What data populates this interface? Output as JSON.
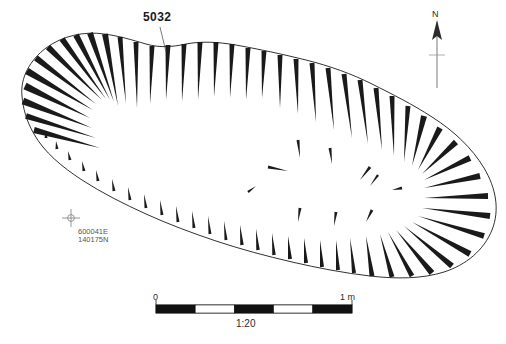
{
  "figure": {
    "type": "archaeological-hachure-plan",
    "background_color": "#ffffff",
    "line_color": "#1a1a1a"
  },
  "feature": {
    "label": "5032",
    "leader_line": true
  },
  "north_arrow": {
    "label": "N"
  },
  "grid_point": {
    "easting": "600041E",
    "northing": "140175N",
    "marker": "grid-cross-icon"
  },
  "scale_bar": {
    "min_label": "0",
    "max_label": "1 m",
    "ratio_label": "1:20",
    "segments": 5,
    "segment_colors": [
      "#111111",
      "#ffffff",
      "#111111",
      "#ffffff",
      "#111111"
    ]
  },
  "outline": {
    "path": "M 22,96 C 20,78 30,60 46,48 C 62,36 84,31 104,34 C 120,36 132,40 146,44 C 160,48 172,47 186,44 C 202,41 218,42 236,45 C 258,49 282,54 306,60 C 330,66 352,74 372,84 C 392,94 412,104 432,117 C 454,131 472,148 484,168 C 496,188 500,210 492,230 C 484,250 466,265 444,272 C 422,279 396,279 370,276 C 344,273 318,268 292,262 C 266,256 240,249 216,241 C 192,233 168,224 146,214 C 124,204 102,193 82,180 C 62,167 44,152 34,134 C 26,120 23,108 22,96 Z"
  },
  "hachures": {
    "description": "Tapered wedges, wide at outline edge, pointing inward toward feature centre",
    "outer": [
      {
        "x1": 25,
        "y1": 86,
        "x2": 90,
        "y2": 118,
        "w": 7
      },
      {
        "x1": 23,
        "y1": 101,
        "x2": 92,
        "y2": 128,
        "w": 7
      },
      {
        "x1": 26,
        "y1": 116,
        "x2": 96,
        "y2": 138,
        "w": 6
      },
      {
        "x1": 34,
        "y1": 130,
        "x2": 100,
        "y2": 148,
        "w": 6
      },
      {
        "x1": 27,
        "y1": 71,
        "x2": 93,
        "y2": 110,
        "w": 7
      },
      {
        "x1": 36,
        "y1": 58,
        "x2": 96,
        "y2": 104,
        "w": 6
      },
      {
        "x1": 48,
        "y1": 47,
        "x2": 102,
        "y2": 100,
        "w": 6
      },
      {
        "x1": 62,
        "y1": 39,
        "x2": 106,
        "y2": 99,
        "w": 6
      },
      {
        "x1": 76,
        "y1": 35,
        "x2": 110,
        "y2": 100,
        "w": 6
      },
      {
        "x1": 90,
        "y1": 33,
        "x2": 114,
        "y2": 102,
        "w": 6
      },
      {
        "x1": 105,
        "y1": 34,
        "x2": 118,
        "y2": 106,
        "w": 6
      },
      {
        "x1": 120,
        "y1": 37,
        "x2": 126,
        "y2": 104,
        "w": 5
      },
      {
        "x1": 136,
        "y1": 42,
        "x2": 137,
        "y2": 108,
        "w": 5
      },
      {
        "x1": 152,
        "y1": 46,
        "x2": 150,
        "y2": 104,
        "w": 5
      },
      {
        "x1": 168,
        "y1": 45,
        "x2": 166,
        "y2": 100,
        "w": 5
      },
      {
        "x1": 184,
        "y1": 44,
        "x2": 182,
        "y2": 102,
        "w": 5
      },
      {
        "x1": 200,
        "y1": 42,
        "x2": 198,
        "y2": 100,
        "w": 5
      },
      {
        "x1": 216,
        "y1": 42,
        "x2": 214,
        "y2": 97,
        "w": 5
      },
      {
        "x1": 232,
        "y1": 44,
        "x2": 230,
        "y2": 98,
        "w": 5
      },
      {
        "x1": 248,
        "y1": 48,
        "x2": 246,
        "y2": 100,
        "w": 5
      },
      {
        "x1": 264,
        "y1": 51,
        "x2": 262,
        "y2": 98,
        "w": 5
      },
      {
        "x1": 280,
        "y1": 55,
        "x2": 280,
        "y2": 108,
        "w": 5
      },
      {
        "x1": 296,
        "y1": 59,
        "x2": 298,
        "y2": 114,
        "w": 5
      },
      {
        "x1": 312,
        "y1": 63,
        "x2": 316,
        "y2": 122,
        "w": 5
      },
      {
        "x1": 328,
        "y1": 68,
        "x2": 334,
        "y2": 130,
        "w": 5
      },
      {
        "x1": 344,
        "y1": 74,
        "x2": 352,
        "y2": 138,
        "w": 5
      },
      {
        "x1": 360,
        "y1": 80,
        "x2": 368,
        "y2": 144,
        "w": 5
      },
      {
        "x1": 376,
        "y1": 88,
        "x2": 382,
        "y2": 150,
        "w": 5
      },
      {
        "x1": 392,
        "y1": 96,
        "x2": 394,
        "y2": 156,
        "w": 5
      },
      {
        "x1": 408,
        "y1": 106,
        "x2": 404,
        "y2": 162,
        "w": 5
      },
      {
        "x1": 424,
        "y1": 116,
        "x2": 412,
        "y2": 166,
        "w": 6
      },
      {
        "x1": 440,
        "y1": 128,
        "x2": 418,
        "y2": 170,
        "w": 6
      },
      {
        "x1": 456,
        "y1": 142,
        "x2": 422,
        "y2": 174,
        "w": 6
      },
      {
        "x1": 470,
        "y1": 158,
        "x2": 424,
        "y2": 180,
        "w": 6
      },
      {
        "x1": 480,
        "y1": 176,
        "x2": 424,
        "y2": 188,
        "w": 6
      },
      {
        "x1": 488,
        "y1": 196,
        "x2": 424,
        "y2": 198,
        "w": 6
      },
      {
        "x1": 490,
        "y1": 216,
        "x2": 422,
        "y2": 208,
        "w": 6
      },
      {
        "x1": 484,
        "y1": 236,
        "x2": 418,
        "y2": 216,
        "w": 6
      },
      {
        "x1": 470,
        "y1": 254,
        "x2": 412,
        "y2": 222,
        "w": 6
      },
      {
        "x1": 452,
        "y1": 266,
        "x2": 404,
        "y2": 226,
        "w": 6
      },
      {
        "x1": 432,
        "y1": 273,
        "x2": 396,
        "y2": 230,
        "w": 6
      },
      {
        "x1": 412,
        "y1": 276,
        "x2": 388,
        "y2": 232,
        "w": 5
      },
      {
        "x1": 392,
        "y1": 277,
        "x2": 380,
        "y2": 234,
        "w": 5
      },
      {
        "x1": 372,
        "y1": 276,
        "x2": 366,
        "y2": 236,
        "w": 5
      },
      {
        "x1": 354,
        "y1": 273,
        "x2": 350,
        "y2": 238,
        "w": 4
      },
      {
        "x1": 338,
        "y1": 270,
        "x2": 336,
        "y2": 240,
        "w": 4
      },
      {
        "x1": 322,
        "y1": 267,
        "x2": 320,
        "y2": 240,
        "w": 4
      },
      {
        "x1": 306,
        "y1": 263,
        "x2": 304,
        "y2": 238,
        "w": 4
      },
      {
        "x1": 290,
        "y1": 259,
        "x2": 288,
        "y2": 236,
        "w": 4
      },
      {
        "x1": 274,
        "y1": 255,
        "x2": 272,
        "y2": 233,
        "w": 3.5
      },
      {
        "x1": 258,
        "y1": 250,
        "x2": 256,
        "y2": 229,
        "w": 3.5
      },
      {
        "x1": 242,
        "y1": 245,
        "x2": 240,
        "y2": 225,
        "w": 3.5
      },
      {
        "x1": 226,
        "y1": 240,
        "x2": 224,
        "y2": 221,
        "w": 3
      },
      {
        "x1": 210,
        "y1": 234,
        "x2": 208,
        "y2": 216,
        "w": 3
      },
      {
        "x1": 194,
        "y1": 228,
        "x2": 192,
        "y2": 211,
        "w": 3
      },
      {
        "x1": 178,
        "y1": 222,
        "x2": 176,
        "y2": 206,
        "w": 3
      },
      {
        "x1": 162,
        "y1": 215,
        "x2": 160,
        "y2": 200,
        "w": 3
      },
      {
        "x1": 146,
        "y1": 208,
        "x2": 144,
        "y2": 194,
        "w": 3
      },
      {
        "x1": 130,
        "y1": 200,
        "x2": 128,
        "y2": 187,
        "w": 3
      },
      {
        "x1": 114,
        "y1": 191,
        "x2": 112,
        "y2": 179,
        "w": 3
      },
      {
        "x1": 98,
        "y1": 181,
        "x2": 96,
        "y2": 170,
        "w": 3
      },
      {
        "x1": 84,
        "y1": 171,
        "x2": 82,
        "y2": 161,
        "w": 3
      },
      {
        "x1": 70,
        "y1": 160,
        "x2": 68,
        "y2": 151,
        "w": 3
      },
      {
        "x1": 57,
        "y1": 149,
        "x2": 56,
        "y2": 141,
        "w": 3
      },
      {
        "x1": 46,
        "y1": 138,
        "x2": 46,
        "y2": 131,
        "w": 3
      }
    ],
    "interior": [
      {
        "x1": 298,
        "y1": 140,
        "x2": 300,
        "y2": 158,
        "w": 3
      },
      {
        "x1": 330,
        "y1": 148,
        "x2": 332,
        "y2": 164,
        "w": 3
      },
      {
        "x1": 268,
        "y1": 167,
        "x2": 288,
        "y2": 171,
        "w": 3
      },
      {
        "x1": 370,
        "y1": 167,
        "x2": 360,
        "y2": 180,
        "w": 3
      },
      {
        "x1": 378,
        "y1": 175,
        "x2": 370,
        "y2": 186,
        "w": 2.5
      },
      {
        "x1": 300,
        "y1": 208,
        "x2": 298,
        "y2": 222,
        "w": 3
      },
      {
        "x1": 336,
        "y1": 212,
        "x2": 334,
        "y2": 226,
        "w": 3
      },
      {
        "x1": 372,
        "y1": 210,
        "x2": 366,
        "y2": 222,
        "w": 3
      },
      {
        "x1": 402,
        "y1": 188,
        "x2": 392,
        "y2": 190,
        "w": 3
      },
      {
        "x1": 248,
        "y1": 192,
        "x2": 256,
        "y2": 186,
        "w": 2.5
      }
    ]
  }
}
